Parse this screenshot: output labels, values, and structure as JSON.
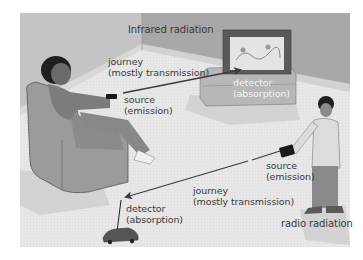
{
  "figure": {
    "colors": {
      "back_wall": "#a9a9a9",
      "left_wall": "#c2c2c2",
      "floor": "#e6e6e6",
      "skirting": "#d6d6d6",
      "beam": "#3c3c3c",
      "label_dark": "#3a3a3a",
      "label_light": "#f4f4f4"
    },
    "infrared": {
      "title": "Infrared radiation",
      "journey": {
        "line1": "journey",
        "line2": "(mostly transmission)"
      },
      "source": {
        "line1": "source",
        "line2": "(emission)"
      },
      "detector": {
        "line1": "detector",
        "line2": "(absorption)"
      }
    },
    "radio": {
      "title": "radio radiation",
      "journey": {
        "line1": "journey",
        "line2": "(mostly transmission)"
      },
      "source": {
        "line1": "source",
        "line2": "(emission)"
      },
      "detector": {
        "line1": "detector",
        "line2": "(absorption)"
      }
    },
    "objects": {
      "person_in_armchair": "man-with-tv-remote",
      "television": "tv-on-stand",
      "boy": "boy-with-radio-controller",
      "toy_car": "remote-control-car"
    }
  }
}
